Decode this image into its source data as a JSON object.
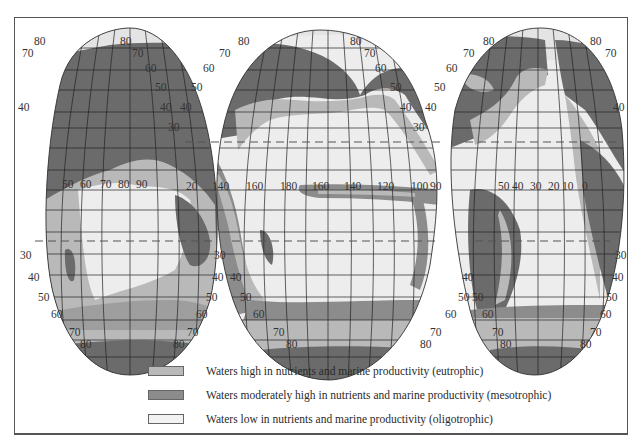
{
  "colors": {
    "land": "#6b6b6b",
    "eutrophic": "#b9b9b9",
    "mesotrophic": "#8c8c8c",
    "oligotrophic": "#ededed",
    "ice": "#e4e4e4",
    "grid": "#222222",
    "frame": "#555555"
  },
  "map": {
    "projection": "interrupted homolosine (three lobes)",
    "lobes": [
      {
        "name": "Indian Ocean / Eurasia lobe",
        "lat_labels_left": [
          "80",
          "70",
          "40",
          "30",
          "40",
          "50",
          "60",
          "70",
          "80"
        ],
        "lat_labels_right": [
          "80",
          "70",
          "60",
          "50",
          "40",
          "30",
          "30",
          "40",
          "50",
          "60",
          "70",
          "80"
        ],
        "lon_labels": [
          "50",
          "60",
          "70",
          "80",
          "90"
        ]
      },
      {
        "name": "Pacific Ocean lobe",
        "lat_labels_left": [
          "80",
          "70",
          "60",
          "50",
          "40",
          "30",
          "40",
          "50",
          "60",
          "70",
          "80"
        ],
        "lat_labels_right": [
          "80",
          "70",
          "60",
          "50",
          "40",
          "30",
          "40",
          "50",
          "60",
          "70",
          "80"
        ],
        "lon_labels": [
          "120",
          "140",
          "160",
          "180",
          "160",
          "140",
          "120",
          "100",
          "90"
        ]
      },
      {
        "name": "Atlantic Ocean lobe",
        "lat_labels_left": [
          "80",
          "70",
          "60",
          "50",
          "40",
          "50",
          "60",
          "70",
          "80"
        ],
        "lat_labels_right": [
          "80",
          "70",
          "40",
          "30",
          "40",
          "50",
          "60",
          "70",
          "80"
        ],
        "lon_labels": [
          "50",
          "40",
          "30",
          "20",
          "10",
          "0"
        ]
      }
    ]
  },
  "legend": {
    "items": [
      {
        "key": "eutrophic",
        "label": "Waters high in nutrients and marine productivity (eutrophic)"
      },
      {
        "key": "mesotrophic",
        "label": "Waters moderately high in nutrients and marine productivity (mesotrophic)"
      },
      {
        "key": "oligotrophic",
        "label": "Waters low in nutrients and marine productivity (oligotrophic)"
      }
    ]
  }
}
